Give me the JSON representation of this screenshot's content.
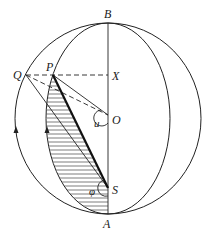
{
  "diagram": {
    "type": "geometric-sphere-construction",
    "labels": {
      "B": "B",
      "A": "A",
      "Q": "Q",
      "P": "P",
      "X": "X",
      "O": "O",
      "S": "S",
      "u": "u",
      "phi": "φ"
    },
    "points": {
      "B": [
        108,
        23
      ],
      "A": [
        108,
        214
      ],
      "Q": [
        26,
        75
      ],
      "P": [
        53,
        75
      ],
      "X": [
        108,
        75
      ],
      "O": [
        108,
        115
      ],
      "S": [
        108,
        188
      ]
    },
    "colors": {
      "stroke": "#222222",
      "hatch": "#444444",
      "background": "#ffffff"
    }
  }
}
